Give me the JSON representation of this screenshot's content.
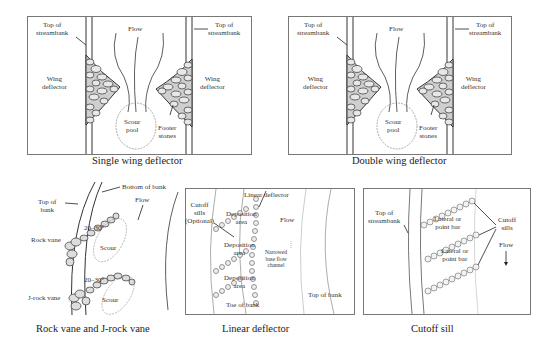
{
  "figure": {
    "panels": [
      {
        "id": "single-wing",
        "caption": "Single wing deflector",
        "labels": {
          "top_left": "Top of\nstreambank",
          "top_right": "Top of\nstreambank",
          "flow": "Flow",
          "wing_left": "Wing\ndeflector",
          "wing_right": "Wing\ndeflector",
          "scour": "Scour\npool",
          "footer": "Footer\nstones"
        }
      },
      {
        "id": "double-wing",
        "caption": "Double wing deflector",
        "labels": {
          "top_left": "Top of\nstreambank",
          "top_right": "Top of\nstreambank",
          "flow": "Flow",
          "wing_left": "Wing\ndeflector",
          "wing_right": "Wing\ndeflector",
          "scour": "Scour\npool",
          "footer": "Footer\nstones"
        }
      },
      {
        "id": "rock-vane",
        "caption": "Rock vane and J-rock vane",
        "labels": {
          "top_of_bank": "Top of\nbank",
          "bottom_of_bank": "Bottom of bank",
          "flow": "Flow",
          "rock_vane": "Rock vane",
          "j_rock_vane": "J-rock vane",
          "angle_1": "20–30°",
          "angle_2": "20–30°",
          "scour_1": "Scour",
          "scour_2": "Scour"
        }
      },
      {
        "id": "linear-deflector",
        "caption": "Linear deflector",
        "labels": {
          "linear_deflector": "Linear deflector",
          "cutoff_sills": "Cutoff\nsills\n(Optional)",
          "deposition_1": "Deposition\narea",
          "deposition_2": "Deposition\narea",
          "deposition_3": "Deposition\narea",
          "flow": "Flow",
          "narrowed": "Narrowed\nbase flow\nchannel",
          "toe_of_bank": "Toe of bank",
          "top_of_bank": "Top of bank"
        }
      },
      {
        "id": "cutoff-sill",
        "caption": "Cutoff sill",
        "labels": {
          "top_of_streambank": "Top of\nstreambank",
          "lateral_1": "Lateral or\npoint bar",
          "lateral_2": "Lateral or\npoint bar",
          "cutoff_sills": "Cutoff\nsills",
          "flow": "Flow"
        }
      }
    ]
  }
}
